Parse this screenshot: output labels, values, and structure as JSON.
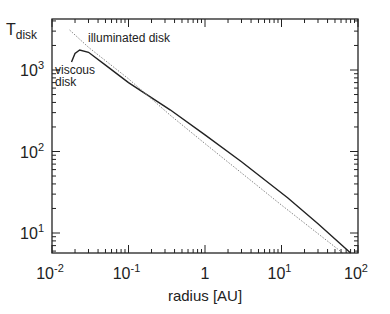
{
  "chart_data": {
    "type": "line",
    "title": "",
    "xlabel": "radius [AU]",
    "ylabel": "T_disk",
    "ylabel_main": "T",
    "ylabel_sub": "disk",
    "xscale": "log",
    "yscale": "log",
    "xlim": [
      0.01,
      100
    ],
    "ylim": [
      5.7,
      4200
    ],
    "grid": false,
    "legend": "inline annotations",
    "x_ticks": [
      {
        "value": 0.01,
        "base": "10",
        "exp": "-2"
      },
      {
        "value": 0.1,
        "base": "10",
        "exp": "-1"
      },
      {
        "value": 1,
        "base": "1",
        "exp": ""
      },
      {
        "value": 10,
        "base": "10",
        "exp": "1"
      },
      {
        "value": 100,
        "base": "10",
        "exp": "2"
      }
    ],
    "y_ticks": [
      {
        "value": 10,
        "base": "10",
        "exp": "1"
      },
      {
        "value": 100,
        "base": "10",
        "exp": "2"
      },
      {
        "value": 1000,
        "base": "10",
        "exp": "3"
      }
    ],
    "series": [
      {
        "name": "viscous disk",
        "style": "solid",
        "x": [
          0.018,
          0.02,
          0.023,
          0.03,
          0.05,
          0.1,
          0.35,
          1,
          3,
          12,
          30,
          80
        ],
        "y": [
          1250,
          1600,
          1760,
          1650,
          1150,
          700,
          325,
          160,
          75,
          27,
          13,
          5.7
        ]
      },
      {
        "name": "illuminated disk",
        "style": "dotted",
        "x": [
          0.017,
          0.03,
          0.1,
          0.35,
          1,
          10,
          63
        ],
        "y": [
          3100,
          1900,
          780,
          280,
          125,
          22,
          5.7
        ]
      }
    ],
    "annotations": [
      {
        "text": "illuminated disk",
        "x": 0.04,
        "y": 2600
      },
      {
        "text": "viscous",
        "x": 0.011,
        "y": 1000
      },
      {
        "text": "disk",
        "x": 0.011,
        "y": 700
      }
    ]
  }
}
